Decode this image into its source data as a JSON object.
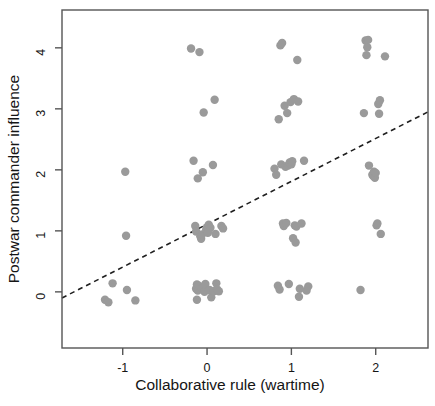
{
  "figure": {
    "background": "#ffffff",
    "point_color": "#9a9a9a",
    "line_color": "#1f1f1f",
    "frame_color": "#555555"
  },
  "chart_data": {
    "type": "scatter",
    "title": "",
    "xlabel": "Collaborative rule (wartime)",
    "ylabel": "Postwar commander influence",
    "xlim": [
      -1.72,
      2.62
    ],
    "ylim": [
      -0.92,
      4.62
    ],
    "xticks": [
      -1,
      0,
      1,
      2
    ],
    "xticklabels": [
      "-1",
      "0",
      "1",
      "2"
    ],
    "yticks": [
      0,
      1,
      2,
      3,
      4
    ],
    "yticklabels": [
      "0",
      "1",
      "2",
      "3",
      "4"
    ],
    "grid": false,
    "legend": false,
    "marker": "filled-circle",
    "marker_color": "#9a9a9a",
    "marker_size": 4.2,
    "jittered": true,
    "points": [
      [
        -1.21,
        -0.13
      ],
      [
        -1.17,
        -0.17
      ],
      [
        -1.12,
        0.14
      ],
      [
        -0.97,
        1.97
      ],
      [
        -0.96,
        0.92
      ],
      [
        -0.95,
        0.03
      ],
      [
        -0.85,
        -0.14
      ],
      [
        -0.19,
        3.99
      ],
      [
        -0.16,
        2.15
      ],
      [
        -0.14,
        1.08
      ],
      [
        -0.13,
        0.99
      ],
      [
        -0.13,
        0.05
      ],
      [
        -0.12,
        0.12
      ],
      [
        -0.12,
        -0.13
      ],
      [
        -0.11,
        1.86
      ],
      [
        -0.11,
        0.02
      ],
      [
        -0.1,
        0.1
      ],
      [
        -0.09,
        3.93
      ],
      [
        -0.08,
        0.91
      ],
      [
        -0.07,
        0.87
      ],
      [
        -0.06,
        0.94
      ],
      [
        -0.06,
        0.06
      ],
      [
        -0.05,
        1.96
      ],
      [
        -0.04,
        2.94
      ],
      [
        -0.03,
        0.0
      ],
      [
        -0.02,
        0.13
      ],
      [
        -0.01,
        1.02
      ],
      [
        0.0,
        1.06
      ],
      [
        0.01,
        0.97
      ],
      [
        0.02,
        1.1
      ],
      [
        0.03,
        0.03
      ],
      [
        0.04,
        1.05
      ],
      [
        0.05,
        -0.09
      ],
      [
        0.07,
        2.08
      ],
      [
        0.08,
        0.01
      ],
      [
        0.09,
        3.15
      ],
      [
        0.1,
        0.95
      ],
      [
        0.11,
        0.14
      ],
      [
        0.12,
        0.04
      ],
      [
        0.14,
        0.01
      ],
      [
        0.17,
        1.08
      ],
      [
        0.19,
        1.04
      ],
      [
        0.8,
        2.02
      ],
      [
        0.82,
        1.92
      ],
      [
        0.84,
        0.1
      ],
      [
        0.85,
        2.83
      ],
      [
        0.86,
        0.04
      ],
      [
        0.87,
        4.04
      ],
      [
        0.88,
        2.09
      ],
      [
        0.89,
        4.08
      ],
      [
        0.9,
        1.12
      ],
      [
        0.91,
        1.08
      ],
      [
        0.92,
        3.05
      ],
      [
        0.93,
        2.05
      ],
      [
        0.94,
        1.13
      ],
      [
        0.95,
        2.93
      ],
      [
        0.96,
        2.07
      ],
      [
        0.97,
        0.13
      ],
      [
        0.98,
        2.12
      ],
      [
        0.99,
        3.11
      ],
      [
        1.0,
        2.09
      ],
      [
        1.01,
        2.14
      ],
      [
        1.02,
        0.88
      ],
      [
        1.03,
        3.16
      ],
      [
        1.04,
        1.09
      ],
      [
        1.05,
        0.81
      ],
      [
        1.06,
        1.07
      ],
      [
        1.07,
        3.8
      ],
      [
        1.08,
        3.12
      ],
      [
        1.09,
        -0.08
      ],
      [
        1.1,
        0.05
      ],
      [
        1.12,
        1.12
      ],
      [
        1.15,
        2.15
      ],
      [
        1.18,
        0.02
      ],
      [
        1.2,
        0.09
      ],
      [
        1.82,
        0.03
      ],
      [
        1.86,
        2.93
      ],
      [
        1.88,
        4.12
      ],
      [
        1.89,
        3.88
      ],
      [
        1.9,
        4.01
      ],
      [
        1.91,
        4.13
      ],
      [
        1.92,
        2.07
      ],
      [
        1.96,
        1.92
      ],
      [
        1.97,
        1.9
      ],
      [
        1.98,
        1.97
      ],
      [
        1.99,
        1.87
      ],
      [
        2.0,
        1.95
      ],
      [
        2.01,
        1.09
      ],
      [
        2.02,
        1.12
      ],
      [
        2.03,
        3.08
      ],
      [
        2.04,
        2.92
      ],
      [
        2.05,
        3.14
      ],
      [
        2.06,
        0.95
      ],
      [
        2.11,
        3.86
      ]
    ],
    "fit_line": {
      "style": "dashed",
      "x0": -1.72,
      "y0": -0.1,
      "x1": 2.62,
      "y1": 2.95
    }
  }
}
